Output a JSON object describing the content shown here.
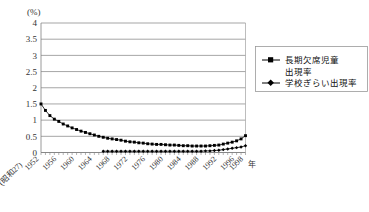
{
  "chart_data": {
    "type": "line",
    "title": "",
    "xlabel": "年",
    "ylabel": "(%)",
    "ylim": [
      0,
      4
    ],
    "yticks": [
      "0",
      "0.5",
      "1",
      "1.5",
      "2",
      "2.5",
      "3",
      "3.5",
      "4"
    ],
    "ytick_values": [
      0,
      0.5,
      1,
      1.5,
      2,
      2.5,
      3,
      3.5,
      4
    ],
    "grid": true,
    "legend_position": "right",
    "era_prefix": "(昭和27)",
    "x_first_label": "1952",
    "x_last_unit": "年",
    "xtick_labels": [
      "1952",
      "1956",
      "1960",
      "1964",
      "1968",
      "1972",
      "1976",
      "1980",
      "1984",
      "1988",
      "1992",
      "1996",
      "1998"
    ],
    "x": [
      1952,
      1953,
      1954,
      1955,
      1956,
      1957,
      1958,
      1959,
      1960,
      1961,
      1962,
      1963,
      1964,
      1965,
      1966,
      1967,
      1968,
      1969,
      1970,
      1971,
      1972,
      1973,
      1974,
      1975,
      1976,
      1977,
      1978,
      1979,
      1980,
      1981,
      1982,
      1983,
      1984,
      1985,
      1986,
      1987,
      1988,
      1989,
      1990,
      1991,
      1992,
      1993,
      1994,
      1995,
      1996,
      1997,
      1998
    ],
    "series": [
      {
        "name": "長期欠席児童出現率",
        "marker": "square",
        "values": [
          1.5,
          1.3,
          1.14,
          1.03,
          0.96,
          0.88,
          0.82,
          0.76,
          0.71,
          0.66,
          0.62,
          0.58,
          0.54,
          0.5,
          0.47,
          0.44,
          0.42,
          0.4,
          0.38,
          0.35,
          0.33,
          0.32,
          0.3,
          0.29,
          0.27,
          0.26,
          0.25,
          0.25,
          0.24,
          0.23,
          0.23,
          0.22,
          0.21,
          0.21,
          0.2,
          0.2,
          0.2,
          0.2,
          0.21,
          0.22,
          0.23,
          0.26,
          0.29,
          0.32,
          0.36,
          0.42,
          0.52
        ]
      },
      {
        "name": "学校ぎらい出現率",
        "marker": "diamond",
        "start_year": 1966,
        "values": [
          null,
          null,
          null,
          null,
          null,
          null,
          null,
          null,
          null,
          null,
          null,
          null,
          null,
          null,
          0.04,
          0.04,
          0.04,
          0.04,
          0.04,
          0.04,
          0.04,
          0.04,
          0.04,
          0.04,
          0.04,
          0.04,
          0.04,
          0.04,
          0.04,
          0.04,
          0.04,
          0.04,
          0.04,
          0.04,
          0.04,
          0.04,
          0.04,
          0.05,
          0.05,
          0.06,
          0.07,
          0.09,
          0.11,
          0.13,
          0.15,
          0.17,
          0.21
        ]
      }
    ]
  },
  "legend": {
    "entries": [
      {
        "line1": "長期欠席児童",
        "line2": "出現率"
      },
      {
        "line1": "学校ぎらい出現率",
        "line2": ""
      }
    ]
  },
  "colors": {
    "series": "#000000",
    "grid": "#808080",
    "frame": "#a0a0a0",
    "text": "#333333",
    "background": "#ffffff"
  }
}
